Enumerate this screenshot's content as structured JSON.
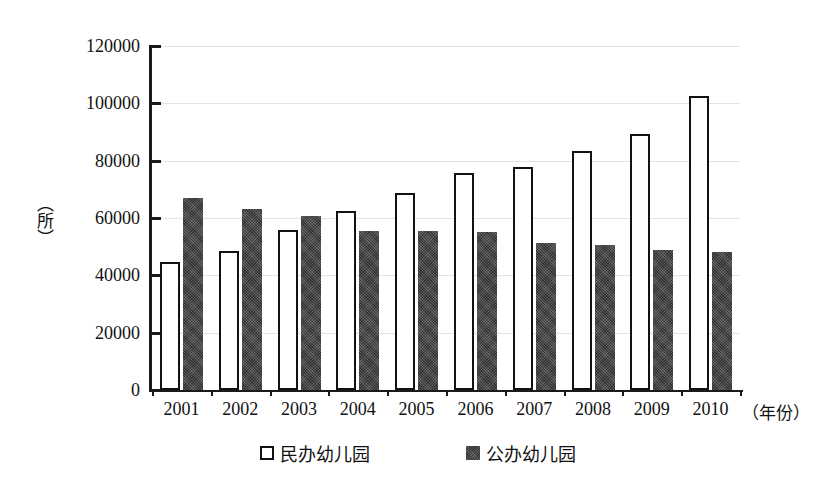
{
  "chart_data": {
    "type": "bar",
    "title": "",
    "subtitle": "",
    "xlabel": "（年份）",
    "ylabel": "（所）",
    "categories": [
      "2001",
      "2002",
      "2003",
      "2004",
      "2005",
      "2006",
      "2007",
      "2008",
      "2009",
      "2010"
    ],
    "series": [
      {
        "name": "民办幼儿园",
        "style": "open-white-bar",
        "color": "#ffffff",
        "border_color": "#121212",
        "values": [
          44800,
          48500,
          55700,
          62500,
          68900,
          75600,
          77800,
          83300,
          89200,
          102500
        ]
      },
      {
        "name": "公办幼儿园",
        "style": "solid-dark-bar",
        "color": "#4a4a4a",
        "border_color": "#4a4a4a",
        "values": [
          67100,
          63100,
          60800,
          55600,
          55500,
          55000,
          51300,
          50500,
          48800,
          48000
        ]
      }
    ],
    "ylim": [
      0,
      120000
    ],
    "ytick_values": [
      0,
      20000,
      40000,
      60000,
      80000,
      100000,
      120000
    ],
    "ytick_labels": [
      "0",
      "20000",
      "40000",
      "60000",
      "80000",
      "100000",
      "120000"
    ],
    "grid": true,
    "grid_axis": "y",
    "legend_position": "bottom-center",
    "axis_color": "#1a1a1a",
    "grid_color": "#e2e2e2",
    "background": "#ffffff"
  }
}
